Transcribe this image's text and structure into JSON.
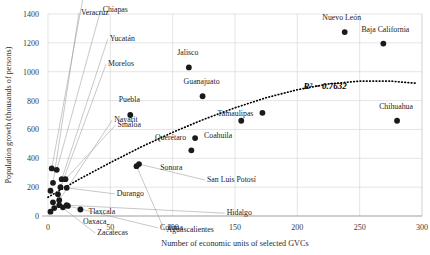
{
  "chart_data": {
    "type": "scatter",
    "title": "",
    "xlabel": "Number of economic units of selected GVCs",
    "ylabel": "Population growth (thousands of persons)",
    "xlim": [
      0,
      300
    ],
    "ylim": [
      0,
      1400
    ],
    "xticks": [
      0,
      50,
      100,
      150,
      200,
      250,
      300
    ],
    "yticks": [
      0,
      200,
      400,
      600,
      800,
      1000,
      1200,
      1400
    ],
    "grid": true,
    "legend": "none",
    "annotations": [
      {
        "text": "R² = 0.7632",
        "x": 205,
        "y": 880
      }
    ],
    "trendline": {
      "type": "polynomial",
      "label": "R² = 0.7632",
      "r_squared": 0.7632,
      "points": [
        {
          "x": 0,
          "y": 130
        },
        {
          "x": 25,
          "y": 255
        },
        {
          "x": 50,
          "y": 370
        },
        {
          "x": 75,
          "y": 480
        },
        {
          "x": 100,
          "y": 580
        },
        {
          "x": 125,
          "y": 670
        },
        {
          "x": 150,
          "y": 750
        },
        {
          "x": 175,
          "y": 820
        },
        {
          "x": 200,
          "y": 875
        },
        {
          "x": 225,
          "y": 915
        },
        {
          "x": 250,
          "y": 935
        },
        {
          "x": 275,
          "y": 935
        },
        {
          "x": 295,
          "y": 920
        }
      ]
    },
    "points": [
      {
        "label": "Nuevo León",
        "x": 238,
        "y": 1275,
        "label_dx": -3,
        "label_dy": -12,
        "anchor": "middle",
        "leader": false
      },
      {
        "label": "Baja California",
        "x": 269,
        "y": 1195,
        "label_dx": 2,
        "label_dy": -12,
        "anchor": "middle",
        "leader": false
      },
      {
        "label": "Jalisco",
        "x": 113,
        "y": 1030,
        "label_dx": -1,
        "label_dy": -12,
        "anchor": "middle",
        "leader": false
      },
      {
        "label": "Guanajuato",
        "x": 124,
        "y": 830,
        "label_dx": -1,
        "label_dy": -12,
        "anchor": "middle",
        "leader": false
      },
      {
        "label": "Tamaulipas",
        "x": 172,
        "y": 715,
        "label_dx": -9,
        "label_dy": 3,
        "anchor": "end",
        "leader": false
      },
      {
        "label": "Coahuila",
        "x": 155,
        "y": 660,
        "label_dx": -9,
        "label_dy": 17,
        "anchor": "end",
        "leader": false
      },
      {
        "label": "Chihuahua",
        "x": 280,
        "y": 660,
        "label_dx": -1,
        "label_dy": -12,
        "anchor": "middle",
        "leader": false
      },
      {
        "label": "Puebla",
        "x": 66,
        "y": 700,
        "label_dx": -1,
        "label_dy": -13,
        "anchor": "middle",
        "leader": false
      },
      {
        "label": "Querétaro",
        "x": 118,
        "y": 540,
        "label_dx": -9,
        "label_dy": 2,
        "anchor": "end",
        "leader": false
      },
      {
        "label": "Sonora",
        "x": 115,
        "y": 455,
        "label_dx": -9,
        "label_dy": 20,
        "anchor": "end",
        "leader": false
      },
      {
        "label": "San Luis Potosí",
        "x": 73,
        "y": 360,
        "label_dx": 68,
        "label_dy": 18,
        "anchor": "start",
        "leader": true
      },
      {
        "label": "Aguascalientes",
        "x": 71,
        "y": 345,
        "label_dx": 30,
        "label_dy": 66,
        "anchor": "start",
        "leader": true
      },
      {
        "label": "Michoacán",
        "x": 3,
        "y": 330,
        "label_dx": 35,
        "label_dy": -178,
        "anchor": "start",
        "leader": true
      },
      {
        "label": "Veracruz",
        "x": 4,
        "y": 230,
        "label_dx": 28,
        "label_dy": -168,
        "anchor": "start",
        "leader": true
      },
      {
        "label": "Chiapas",
        "x": 7,
        "y": 320,
        "label_dx": 46,
        "label_dy": -158,
        "anchor": "start",
        "leader": true
      },
      {
        "label": "Yucatán",
        "x": 11,
        "y": 255,
        "label_dx": 48,
        "label_dy": -138,
        "anchor": "start",
        "leader": true
      },
      {
        "label": "Morelos",
        "x": 8,
        "y": 150,
        "label_dx": 50,
        "label_dy": -128,
        "anchor": "start",
        "leader": true
      },
      {
        "label": "Nayarit",
        "x": 9,
        "y": 110,
        "label_dx": 55,
        "label_dy": -78,
        "anchor": "start",
        "leader": true
      },
      {
        "label": "Sinaloa",
        "x": 14,
        "y": 255,
        "label_dx": 52,
        "label_dy": -52,
        "anchor": "start",
        "leader": true
      },
      {
        "label": "Durango",
        "x": 15,
        "y": 195,
        "label_dx": 50,
        "label_dy": 8,
        "anchor": "start",
        "leader": true
      },
      {
        "label": "Oaxaca",
        "x": 4,
        "y": 95,
        "label_dx": 30,
        "label_dy": 22,
        "anchor": "start",
        "leader": false
      },
      {
        "label": "Zacatecas",
        "x": 9,
        "y": 75,
        "label_dx": 38,
        "label_dy": 30,
        "anchor": "start",
        "leader": true
      },
      {
        "label": "Tlaxcala",
        "x": 26,
        "y": 45,
        "label_dx": 8,
        "label_dy": 4,
        "anchor": "start",
        "leader": false
      },
      {
        "label": "Colima",
        "x": 16,
        "y": 70,
        "label_dx": 92,
        "label_dy": 24,
        "anchor": "start",
        "leader": true
      },
      {
        "label": "Hidalgo",
        "x": 15,
        "y": 75,
        "label_dx": 160,
        "label_dy": 10,
        "anchor": "start",
        "leader": true
      },
      {
        "label": "",
        "x": 2,
        "y": 175,
        "label_dx": 0,
        "label_dy": 0,
        "anchor": "start",
        "leader": false
      },
      {
        "label": "",
        "x": 2,
        "y": 30,
        "label_dx": 0,
        "label_dy": 0,
        "anchor": "start",
        "leader": false
      },
      {
        "label": "",
        "x": 5,
        "y": 55,
        "label_dx": 0,
        "label_dy": 0,
        "anchor": "start",
        "leader": false
      },
      {
        "label": "",
        "x": 12,
        "y": 60,
        "label_dx": 0,
        "label_dy": 0,
        "anchor": "start",
        "leader": false
      },
      {
        "label": "",
        "x": 10,
        "y": 200,
        "label_dx": 0,
        "label_dy": 0,
        "anchor": "start",
        "leader": false
      }
    ]
  }
}
